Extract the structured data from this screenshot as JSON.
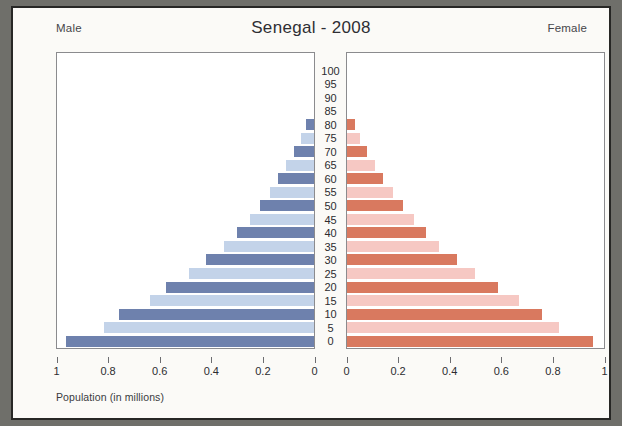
{
  "chart_data": {
    "type": "bar",
    "subtype": "population-pyramid",
    "title": "Senegal - 2008",
    "xlabel": "Population (in millions)",
    "ylabel": "",
    "grid": false,
    "legend_position": "top-corners",
    "left_panel_label": "Male",
    "right_panel_label": "Female",
    "left_axis_ticks": [
      "1",
      "0.8",
      "0.6",
      "0.4",
      "0.2",
      "0"
    ],
    "left_axis_values": [
      1,
      0.8,
      0.6,
      0.4,
      0.2,
      0
    ],
    "right_axis_ticks": [
      "0",
      "0.2",
      "0.4",
      "0.6",
      "0.8",
      "1"
    ],
    "right_axis_values": [
      0,
      0.2,
      0.4,
      0.6,
      0.8,
      1
    ],
    "xlim": [
      0,
      1
    ],
    "left_axis_reversed": true,
    "categories": [
      "0",
      "5",
      "10",
      "15",
      "20",
      "25",
      "30",
      "35",
      "40",
      "45",
      "50",
      "55",
      "60",
      "65",
      "70",
      "75",
      "80",
      "85",
      "90",
      "95",
      "100"
    ],
    "series": [
      {
        "name": "Male",
        "side": "left",
        "values": [
          0.97,
          0.82,
          0.76,
          0.64,
          0.58,
          0.49,
          0.42,
          0.35,
          0.3,
          0.25,
          0.21,
          0.17,
          0.14,
          0.11,
          0.08,
          0.05,
          0.03,
          0.0,
          0.0,
          0.0,
          0.0
        ]
      },
      {
        "name": "Female",
        "side": "right",
        "values": [
          0.96,
          0.83,
          0.76,
          0.67,
          0.59,
          0.5,
          0.43,
          0.36,
          0.31,
          0.26,
          0.22,
          0.18,
          0.14,
          0.11,
          0.08,
          0.05,
          0.03,
          0.0,
          0.0,
          0.0,
          0.0
        ]
      }
    ],
    "colors": {
      "male_dark": "#6e81ad",
      "male_light": "#c3d3e9",
      "female_dark": "#d9795f",
      "female_light": "#f6c8c3"
    }
  }
}
